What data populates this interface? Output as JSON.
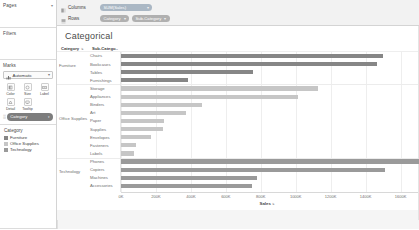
{
  "sidebar": {
    "pages": {
      "title": "Pages",
      "caret": "▾"
    },
    "filters": {
      "title": "Filters"
    },
    "marks": {
      "title": "Marks",
      "type_value": "Automatic",
      "type_caret": "▾",
      "buttons": [
        {
          "label": "Color",
          "icon": "color-icon"
        },
        {
          "label": "Size",
          "icon": "size-icon"
        },
        {
          "label": "Label",
          "icon": "label-icon"
        },
        {
          "label": "Detail",
          "icon": "detail-icon"
        },
        {
          "label": "Tooltip",
          "icon": "tooltip-icon"
        }
      ],
      "encoding_pill": {
        "prefix": "░",
        "text": "Category",
        "caret": "▾"
      }
    },
    "legend": {
      "title": "Category",
      "items": [
        {
          "label": "Furniture",
          "color": "#868686"
        },
        {
          "label": "Office Supplies",
          "color": "#c6c6c6"
        },
        {
          "label": "Technology",
          "color": "#9a9a9a"
        }
      ]
    }
  },
  "shelves": {
    "columns": {
      "label": "Columns",
      "icon": "columns-icon",
      "pills": [
        {
          "text": "SUM(Sales)",
          "caret": "▾",
          "kind": "measure"
        }
      ]
    },
    "rows": {
      "label": "Rows",
      "icon": "rows-icon",
      "pills": [
        {
          "text": "Category",
          "caret": "▾",
          "kind": "dim"
        },
        {
          "text": "Sub-Category",
          "caret": "▾",
          "kind": "dim"
        }
      ]
    }
  },
  "sheet": {
    "title": "Categorical",
    "column_headers": [
      {
        "label": "Category",
        "sort_icon": "sort-icon"
      },
      {
        "label": "Sub-Catego..",
        "sort_icon": ""
      }
    ]
  },
  "chart_data": {
    "type": "bar",
    "orientation": "horizontal",
    "title": "Categorical",
    "xlabel": "Sales",
    "ylabel": "",
    "xlim": [
      0,
      1700000
    ],
    "xticks": [
      0,
      200000,
      400000,
      600000,
      800000,
      1000000,
      1200000,
      1400000,
      1600000
    ],
    "xtick_labels": [
      "0K",
      "200K",
      "400K",
      "600K",
      "800K",
      "1000K",
      "1200K",
      "1400K",
      "1600K"
    ],
    "grid": true,
    "legend_position": "left-sidebar",
    "legend_title": "Category",
    "groups": [
      {
        "name": "Furniture",
        "color": "#868686",
        "items": [
          {
            "label": "Chairs",
            "value": 1501682
          },
          {
            "label": "Bookcases",
            "value": 1466572
          },
          {
            "label": "Tables",
            "value": 757041
          },
          {
            "label": "Furnishings",
            "value": 385578
          }
        ]
      },
      {
        "name": "Office Supplies",
        "color": "#c6c6c6",
        "items": [
          {
            "label": "Storage",
            "value": 1127086
          },
          {
            "label": "Appliances",
            "value": 1011064
          },
          {
            "label": "Binders",
            "value": 461912
          },
          {
            "label": "Art",
            "value": 372092
          },
          {
            "label": "Paper",
            "value": 244291
          },
          {
            "label": "Supplies",
            "value": 243074
          },
          {
            "label": "Envelopes",
            "value": 170904
          },
          {
            "label": "Fasteners",
            "value": 83242
          },
          {
            "label": "Labels",
            "value": 73404
          }
        ]
      },
      {
        "name": "Technology",
        "color": "#9a9a9a",
        "items": [
          {
            "label": "Phones",
            "value": 1706824
          },
          {
            "label": "Copiers",
            "value": 1509436
          },
          {
            "label": "Machines",
            "value": 779060
          },
          {
            "label": "Accessories",
            "value": 749237
          }
        ]
      }
    ]
  }
}
